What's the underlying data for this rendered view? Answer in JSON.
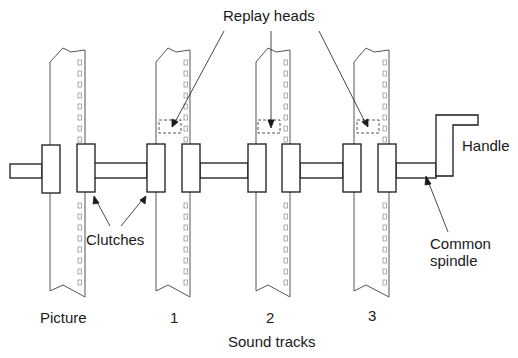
{
  "diagram": {
    "type": "mechanical-schematic",
    "labels": {
      "replay_heads": "Replay heads",
      "handle": "Handle",
      "clutches": "Clutches",
      "common_spindle_line1": "Common",
      "common_spindle_line2": "spindle",
      "picture": "Picture",
      "track1": "1",
      "track2": "2",
      "track3": "3",
      "sound_tracks": "Sound tracks"
    },
    "films": [
      {
        "name": "Picture",
        "has_replay_head": false
      },
      {
        "name": "1",
        "has_replay_head": true
      },
      {
        "name": "2",
        "has_replay_head": true
      },
      {
        "name": "3",
        "has_replay_head": true
      }
    ],
    "colors": {
      "line": "#1a1a1a",
      "film_edge": "#555555",
      "background": "#ffffff"
    }
  }
}
